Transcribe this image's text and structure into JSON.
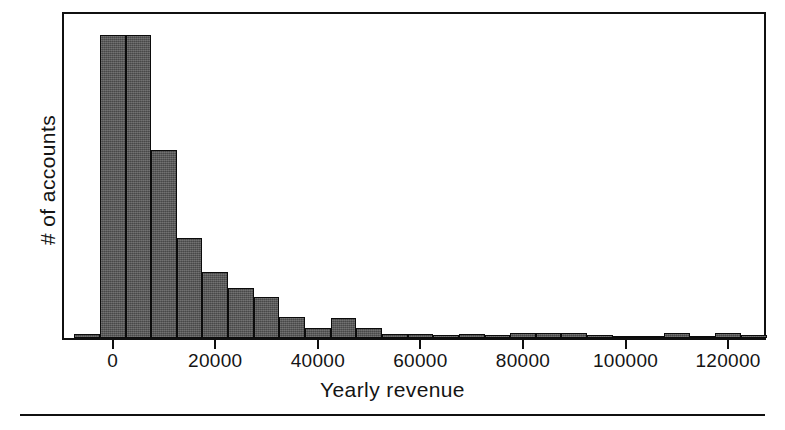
{
  "chart_data": {
    "type": "bar",
    "title": "",
    "subtitle": "",
    "xlabel": "Yearly revenue",
    "ylabel": "# of accounts",
    "grid": false,
    "legend": null,
    "xlim": [
      -9500,
      127000
    ],
    "ylim": [
      0,
      340
    ],
    "bin_width": 5000,
    "xticks": [
      0,
      20000,
      40000,
      60000,
      80000,
      100000,
      120000
    ],
    "xticklabels": [
      "0",
      "20000",
      "40000",
      "60000",
      "80000",
      "100000",
      "120000"
    ],
    "yticks": [],
    "yticklabels": [],
    "note": "Right-skewed histogram of yearly revenue per account; bin width 5000; y axis is unlabeled counts, heights read off pixel extents relative to the tallest bin.",
    "bins": [
      {
        "x0": -7500,
        "x1": -2500,
        "value": 4
      },
      {
        "x0": -2500,
        "x1": 2500,
        "value": 318
      },
      {
        "x0": 2500,
        "x1": 7500,
        "value": 318
      },
      {
        "x0": 7500,
        "x1": 12500,
        "value": 197
      },
      {
        "x0": 12500,
        "x1": 17500,
        "value": 105
      },
      {
        "x0": 17500,
        "x1": 22500,
        "value": 69
      },
      {
        "x0": 22500,
        "x1": 27500,
        "value": 53
      },
      {
        "x0": 27500,
        "x1": 32500,
        "value": 43
      },
      {
        "x0": 32500,
        "x1": 37500,
        "value": 22
      },
      {
        "x0": 37500,
        "x1": 42500,
        "value": 11
      },
      {
        "x0": 42500,
        "x1": 47500,
        "value": 21
      },
      {
        "x0": 47500,
        "x1": 52500,
        "value": 10
      },
      {
        "x0": 52500,
        "x1": 57500,
        "value": 4
      },
      {
        "x0": 57500,
        "x1": 62500,
        "value": 4
      },
      {
        "x0": 62500,
        "x1": 67500,
        "value": 3
      },
      {
        "x0": 67500,
        "x1": 72500,
        "value": 4
      },
      {
        "x0": 72500,
        "x1": 77500,
        "value": 3
      },
      {
        "x0": 77500,
        "x1": 82500,
        "value": 5
      },
      {
        "x0": 82500,
        "x1": 87500,
        "value": 5
      },
      {
        "x0": 87500,
        "x1": 92500,
        "value": 5
      },
      {
        "x0": 92500,
        "x1": 97500,
        "value": 3
      },
      {
        "x0": 97500,
        "x1": 102500,
        "value": 2
      },
      {
        "x0": 102500,
        "x1": 107500,
        "value": 2
      },
      {
        "x0": 107500,
        "x1": 112500,
        "value": 5
      },
      {
        "x0": 112500,
        "x1": 117500,
        "value": 2
      },
      {
        "x0": 117500,
        "x1": 122500,
        "value": 5
      },
      {
        "x0": 122500,
        "x1": 127500,
        "value": 3
      }
    ],
    "colors": {
      "bar_fill": "#565656",
      "bar_edge": "#0b0b0b",
      "axis": "#101010",
      "text": "#141414",
      "background": "#ffffff"
    }
  }
}
